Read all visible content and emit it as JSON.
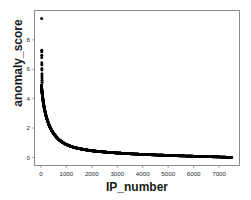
{
  "chart_data": {
    "type": "scatter",
    "title": "",
    "xlabel": "IP_number",
    "ylabel": "anomaly_score",
    "xlim": [
      -250,
      7800
    ],
    "ylim": [
      -0.55,
      10.0
    ],
    "xticks": [
      0,
      1000,
      2000,
      3000,
      4000,
      5000,
      6000,
      7000
    ],
    "xticklabels": [
      "0",
      "1000",
      "2000",
      "3000",
      "4000",
      "5000",
      "6000",
      "7000"
    ],
    "yticks": [
      0,
      2,
      4,
      6,
      8
    ],
    "yticklabels": [
      "0",
      "2",
      "4",
      "6",
      "8"
    ],
    "grid": false,
    "legend": null,
    "marker_color": "#000000",
    "frame_color": "#8c8c8c",
    "background_color": "#ffffff",
    "outliers": [
      {
        "x": 30,
        "y": 9.45
      },
      {
        "x": 34,
        "y": 7.3
      },
      {
        "x": 34,
        "y": 7.2
      },
      {
        "x": 36,
        "y": 6.95
      },
      {
        "x": 36,
        "y": 6.8
      },
      {
        "x": 38,
        "y": 6.45
      },
      {
        "x": 38,
        "y": 6.3
      },
      {
        "x": 40,
        "y": 6.05
      },
      {
        "x": 40,
        "y": 5.95
      },
      {
        "x": 42,
        "y": 5.7
      },
      {
        "x": 42,
        "y": 5.55
      },
      {
        "x": 44,
        "y": 5.4
      },
      {
        "x": 44,
        "y": 5.25
      },
      {
        "x": 46,
        "y": 5.1
      }
    ],
    "curve_points": [
      {
        "x": 20,
        "y": 4.9
      },
      {
        "x": 40,
        "y": 4.55
      },
      {
        "x": 60,
        "y": 4.25
      },
      {
        "x": 80,
        "y": 3.95
      },
      {
        "x": 100,
        "y": 3.7
      },
      {
        "x": 130,
        "y": 3.4
      },
      {
        "x": 160,
        "y": 3.15
      },
      {
        "x": 200,
        "y": 2.85
      },
      {
        "x": 250,
        "y": 2.55
      },
      {
        "x": 300,
        "y": 2.3
      },
      {
        "x": 360,
        "y": 2.05
      },
      {
        "x": 430,
        "y": 1.82
      },
      {
        "x": 500,
        "y": 1.62
      },
      {
        "x": 600,
        "y": 1.4
      },
      {
        "x": 700,
        "y": 1.22
      },
      {
        "x": 800,
        "y": 1.08
      },
      {
        "x": 950,
        "y": 0.92
      },
      {
        "x": 1100,
        "y": 0.8
      },
      {
        "x": 1300,
        "y": 0.68
      },
      {
        "x": 1500,
        "y": 0.6
      },
      {
        "x": 1750,
        "y": 0.52
      },
      {
        "x": 2000,
        "y": 0.45
      },
      {
        "x": 2300,
        "y": 0.4
      },
      {
        "x": 2600,
        "y": 0.35
      },
      {
        "x": 3000,
        "y": 0.3
      },
      {
        "x": 3400,
        "y": 0.26
      },
      {
        "x": 3800,
        "y": 0.22
      },
      {
        "x": 4200,
        "y": 0.19
      },
      {
        "x": 4600,
        "y": 0.16
      },
      {
        "x": 5000,
        "y": 0.14
      },
      {
        "x": 5400,
        "y": 0.11
      },
      {
        "x": 5800,
        "y": 0.09
      },
      {
        "x": 6200,
        "y": 0.07
      },
      {
        "x": 6600,
        "y": 0.05
      },
      {
        "x": 7000,
        "y": 0.03
      },
      {
        "x": 7300,
        "y": 0.01
      },
      {
        "x": 7500,
        "y": 0.0
      }
    ]
  }
}
